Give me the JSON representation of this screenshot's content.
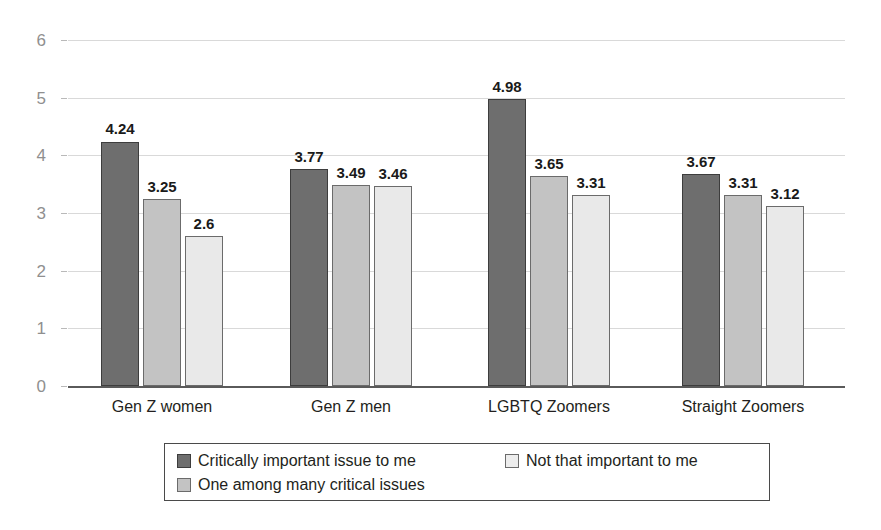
{
  "chart_data": {
    "type": "bar",
    "title": "",
    "subtitle": "",
    "xlabel": "",
    "ylabel": "",
    "ylim": [
      0,
      6
    ],
    "yticks": [
      "0",
      "1",
      "2",
      "3",
      "4",
      "5",
      "6"
    ],
    "grid": true,
    "legend_position": "bottom",
    "categories": [
      "Gen Z women",
      "Gen Z men",
      "LGBTQ Zoomers",
      "Straight Zoomers"
    ],
    "series": [
      {
        "name": "Critically important issue to me",
        "color": "#6e6e6e",
        "values": [
          4.24,
          3.77,
          4.98,
          3.67
        ],
        "labels": [
          "4.24",
          "3.77",
          "4.98",
          "3.67"
        ]
      },
      {
        "name": "One among many critical issues",
        "color": "#c3c3c3",
        "values": [
          3.25,
          3.49,
          3.65,
          3.31
        ],
        "labels": [
          "3.25",
          "3.49",
          "3.65",
          "3.31"
        ]
      },
      {
        "name": "Not that important to me",
        "color": "#e9e9e9",
        "values": [
          2.6,
          3.46,
          3.31,
          3.12
        ],
        "labels": [
          "2.6",
          "3.46",
          "3.31",
          "3.12"
        ]
      }
    ]
  },
  "legend": {
    "entries": [
      {
        "label": "Critically important issue to me",
        "series": 0
      },
      {
        "label": "Not that important to me",
        "series": 2
      },
      {
        "label": "One among many critical issues",
        "series": 1
      }
    ]
  },
  "colors": {
    "series_dark": "#6e6e6e",
    "series_medium": "#c3c3c3",
    "series_light": "#e9e9e9",
    "gridline": "#d9d9d9",
    "axis": "#5a5a5a",
    "text": "#231f20",
    "tick_text": "#8f8f8f",
    "background": "#ffffff"
  }
}
